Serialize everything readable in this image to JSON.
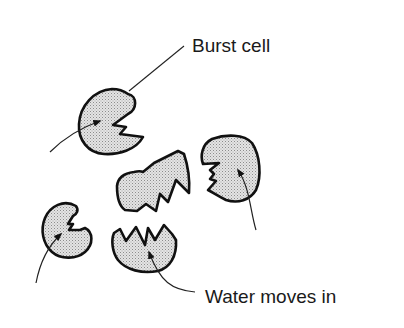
{
  "diagram": {
    "title": "",
    "labels": {
      "burst_cell": "Burst cell",
      "water_moves_in": "Water moves in"
    },
    "cells": [
      {
        "id": "cell-top-left",
        "state": "burst"
      },
      {
        "id": "cell-center",
        "state": "burst"
      },
      {
        "id": "cell-right",
        "state": "burst"
      },
      {
        "id": "cell-bottom-left",
        "state": "burst"
      },
      {
        "id": "cell-bottom-center",
        "state": "burst"
      }
    ],
    "colors": {
      "outline": "#111111",
      "fill": "#d9d9d9",
      "stipple": "#9a9a9a",
      "background": "#ffffff"
    }
  }
}
